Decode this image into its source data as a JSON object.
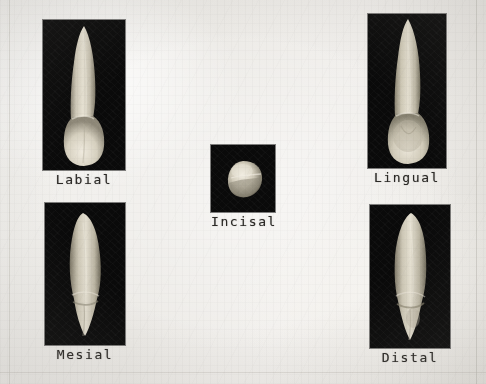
{
  "plate": {
    "background_color": "#efedea",
    "panel_color": "#0a0a0a",
    "caption_color": "#2b2926",
    "specimen_color": "#d9d4c6"
  },
  "panels": [
    {
      "id": "labial",
      "caption": "Labial",
      "aspect": "labial",
      "icon": "tooth-labial-icon",
      "frame": {
        "x": 43,
        "y": 20,
        "w": 82,
        "h": 150
      },
      "caption_y": 172
    },
    {
      "id": "lingual",
      "caption": "Lingual",
      "aspect": "lingual",
      "icon": "tooth-lingual-icon",
      "frame": {
        "x": 368,
        "y": 14,
        "w": 78,
        "h": 154
      },
      "caption_y": 170
    },
    {
      "id": "incisal",
      "caption": "Incisal",
      "aspect": "incisal",
      "icon": "tooth-incisal-icon",
      "frame": {
        "x": 211,
        "y": 145,
        "w": 64,
        "h": 67
      },
      "caption_y": 214
    },
    {
      "id": "mesial",
      "caption": "Mesial",
      "aspect": "mesial",
      "icon": "tooth-mesial-icon",
      "frame": {
        "x": 45,
        "y": 203,
        "w": 80,
        "h": 142
      },
      "caption_y": 347
    },
    {
      "id": "distal",
      "caption": "Distal",
      "aspect": "distal",
      "icon": "tooth-distal-icon",
      "frame": {
        "x": 370,
        "y": 205,
        "w": 80,
        "h": 143
      },
      "caption_y": 350
    }
  ],
  "page_edges": [
    {
      "name": "left-margin-rule",
      "orient": "v",
      "x": 9,
      "y": 0,
      "len": 384
    },
    {
      "name": "right-margin-rule",
      "orient": "v",
      "x": 476,
      "y": 0,
      "len": 384
    },
    {
      "name": "bottom-margin-rule",
      "orient": "h",
      "x": 0,
      "y": 372,
      "len": 486
    }
  ]
}
